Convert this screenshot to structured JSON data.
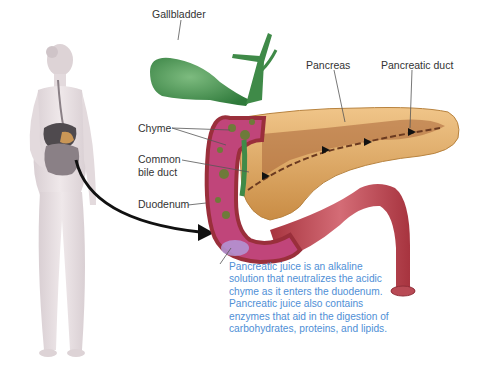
{
  "labels": {
    "gallbladder": "Gallbladder",
    "pancreas": "Pancreas",
    "pancreatic_duct": "Pancreatic duct",
    "chyme": "Chyme",
    "common_bile_duct_line1": "Common",
    "common_bile_duct_line2": "bile duct",
    "duodenum": "Duodenum"
  },
  "caption": {
    "lines": [
      "Pancreatic juice is an alkaline",
      "solution that neutralizes the acidic",
      "chyme as it enters the duodenum.",
      "Pancreatic juice also contains",
      "enzymes that aid in the digestion of",
      "carbohydrates, proteins, and lipids."
    ]
  },
  "colors": {
    "caption_text": "#4f8fd6",
    "label_text": "#333333",
    "gallbladder": "#3f8a48",
    "pancreas": "#d9a05a",
    "duodenum_wall": "#b2434f",
    "duodenum_inner": "#c0457a",
    "body": "#e6dde0",
    "arrow": "#111111"
  }
}
